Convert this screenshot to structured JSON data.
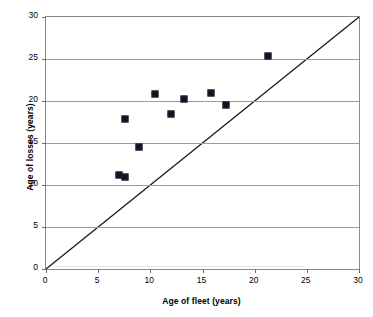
{
  "chart_data": {
    "type": "scatter",
    "title": "",
    "xlabel": "Age of fleet (years)",
    "ylabel": "Age of losses (years)",
    "xlim": [
      0,
      30
    ],
    "ylim": [
      0,
      30
    ],
    "xticks": [
      0,
      5,
      10,
      15,
      20,
      25,
      30
    ],
    "yticks": [
      0,
      5,
      10,
      15,
      20,
      25,
      30
    ],
    "xtick_labels": [
      "0",
      "5",
      "10",
      "15",
      "20",
      "25",
      "30"
    ],
    "ytick_labels": [
      "0",
      "5",
      "10",
      "15",
      "20",
      "25",
      "30"
    ],
    "grid": "horizontal",
    "legend": "none",
    "marker": {
      "shape": "square",
      "color": "#12121b",
      "size_px": 7
    },
    "series": [
      {
        "name": "Fleet vs losses",
        "points": [
          {
            "x": 7.0,
            "y": 11.2
          },
          {
            "x": 7.6,
            "y": 11.0
          },
          {
            "x": 7.6,
            "y": 17.8
          },
          {
            "x": 8.9,
            "y": 14.5
          },
          {
            "x": 10.4,
            "y": 20.8
          },
          {
            "x": 12.0,
            "y": 18.5
          },
          {
            "x": 13.2,
            "y": 20.2
          },
          {
            "x": 15.8,
            "y": 20.9
          },
          {
            "x": 17.3,
            "y": 19.5
          },
          {
            "x": 21.3,
            "y": 25.3
          }
        ]
      }
    ],
    "reference_line": {
      "name": "parity-line",
      "description": "y = x diagonal",
      "from": {
        "x": 0,
        "y": 0
      },
      "to": {
        "x": 30,
        "y": 30
      },
      "color": "#1a1a1a"
    },
    "colors": {
      "marker": "#12121b",
      "gridline": "#9a9aa8",
      "axis": "#8a8a8a",
      "reference_line": "#1a1a1a",
      "background": "#ffffff",
      "text": "#000000"
    }
  }
}
